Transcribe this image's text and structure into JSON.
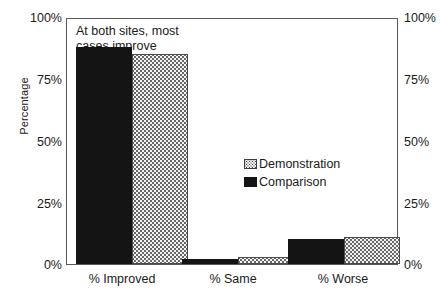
{
  "chart_data": {
    "type": "bar",
    "title": "",
    "annotation": "At both sites, most\ncases improve",
    "categories": [
      "% Improved",
      "% Same",
      "% Worse"
    ],
    "series": [
      {
        "name": "Comparison",
        "values": [
          88,
          2,
          10
        ]
      },
      {
        "name": "Demonstration",
        "values": [
          85,
          3,
          11
        ]
      }
    ],
    "xlabel": "",
    "ylabel": "Percentage",
    "ylim": [
      0,
      100
    ],
    "ytick_labels": [
      "100%",
      "75%",
      "50%",
      "25%",
      "0%"
    ],
    "ytick_values": [
      100,
      75,
      50,
      25,
      0
    ],
    "right_axis": true,
    "right_ytick_labels": [
      "100%",
      "75%",
      "50%",
      "25%",
      "0%"
    ],
    "grid": false,
    "legend_position": "inside-right",
    "legend_entries": [
      {
        "label": "Demonstration",
        "swatch": "dotted-light"
      },
      {
        "label": "Comparison",
        "swatch": "solid-black"
      }
    ],
    "colors": {
      "comparison": "#141414",
      "demonstration": "#f2f2f2",
      "axis": "#5a5a5a",
      "text": "#1a1a1a",
      "background": "#ffffff"
    }
  }
}
